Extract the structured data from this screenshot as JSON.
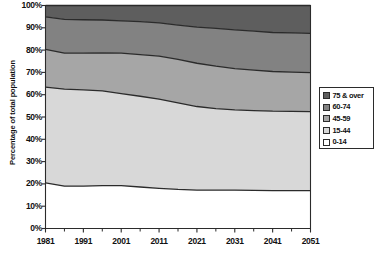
{
  "chart_data": {
    "type": "area",
    "stacked": true,
    "title": "",
    "xlabel": "",
    "ylabel": "Percentage of total population",
    "xlim": [
      1981,
      2051
    ],
    "ylim": [
      0,
      100
    ],
    "grid": false,
    "legend_position": "right",
    "x": [
      1981,
      1986,
      1991,
      1996,
      2001,
      2006,
      2011,
      2016,
      2021,
      2026,
      2031,
      2036,
      2041,
      2046,
      2051
    ],
    "x_tick_labels": [
      "1981",
      "1991",
      "2001",
      "2011",
      "2021",
      "2031",
      "2041",
      "2051"
    ],
    "x_tick_values": [
      1981,
      1991,
      2001,
      2011,
      2021,
      2031,
      2041,
      2051
    ],
    "x_minor_tick_values": [
      1986,
      1996,
      2006,
      2016,
      2026,
      2036,
      2046
    ],
    "y_tick_labels": [
      "0%",
      "10%",
      "20%",
      "30%",
      "40%",
      "50%",
      "60%",
      "70%",
      "80%",
      "90%",
      "100%"
    ],
    "y_tick_values": [
      0,
      10,
      20,
      30,
      40,
      50,
      60,
      70,
      80,
      90,
      100
    ],
    "series": [
      {
        "name": "0-14",
        "color": "#ffffff",
        "values": [
          20.5,
          19.0,
          19.0,
          19.2,
          19.2,
          18.6,
          18.0,
          17.5,
          17.2,
          17.2,
          17.2,
          17.1,
          17.0,
          17.0,
          17.0
        ]
      },
      {
        "name": "15-44",
        "color": "#d8d8d8",
        "values": [
          42.9,
          43.5,
          43.2,
          42.5,
          41.3,
          40.7,
          40.0,
          38.8,
          37.5,
          36.6,
          36.0,
          35.8,
          35.6,
          35.5,
          35.4
        ]
      },
      {
        "name": "45-59",
        "color": "#a6a6a6",
        "values": [
          16.9,
          16.1,
          16.4,
          17.1,
          18.1,
          18.7,
          19.3,
          19.5,
          19.4,
          19.0,
          18.5,
          18.1,
          17.8,
          17.6,
          17.5
        ]
      },
      {
        "name": "60-74",
        "color": "#828282",
        "values": [
          14.6,
          15.2,
          15.0,
          14.7,
          14.5,
          14.8,
          14.9,
          15.4,
          16.2,
          16.9,
          17.4,
          17.5,
          17.5,
          17.6,
          17.6
        ]
      },
      {
        "name": "75 & over",
        "color": "#5e5e5e",
        "values": [
          5.1,
          6.2,
          6.4,
          6.5,
          6.9,
          7.2,
          7.8,
          8.8,
          9.7,
          10.3,
          10.9,
          11.5,
          12.1,
          12.3,
          12.5
        ]
      }
    ],
    "cumulative_boundaries": {
      "top_of_0_14": [
        20.5,
        19.0,
        19.0,
        19.2,
        19.2,
        18.6,
        18.0,
        17.5,
        17.2,
        17.2,
        17.2,
        17.1,
        17.0,
        17.0,
        17.0
      ],
      "top_of_15_44": [
        63.4,
        62.5,
        62.2,
        61.7,
        60.5,
        59.3,
        58.0,
        56.3,
        54.7,
        53.8,
        53.2,
        52.9,
        52.6,
        52.5,
        52.4
      ],
      "top_of_45_59": [
        80.3,
        78.6,
        78.6,
        78.8,
        78.6,
        78.0,
        77.3,
        75.8,
        74.1,
        72.8,
        71.7,
        71.0,
        70.4,
        70.1,
        69.9
      ],
      "top_of_60_74": [
        94.9,
        93.8,
        93.6,
        93.5,
        93.1,
        92.8,
        92.2,
        91.2,
        90.3,
        89.7,
        89.1,
        88.5,
        87.9,
        87.7,
        87.5
      ],
      "top_of_75_over": [
        100,
        100,
        100,
        100,
        100,
        100,
        100,
        100,
        100,
        100,
        100,
        100,
        100,
        100,
        100
      ]
    }
  },
  "legend": {
    "items": [
      {
        "label": "75 & over",
        "color": "#5e5e5e"
      },
      {
        "label": "60-74",
        "color": "#828282"
      },
      {
        "label": "45-59",
        "color": "#a6a6a6"
      },
      {
        "label": "15-44",
        "color": "#d8d8d8"
      },
      {
        "label": "0-14",
        "color": "#ffffff"
      }
    ]
  },
  "axes": {
    "y_title": "Percentage of total population"
  },
  "style": {
    "line_color": "#2b2b2b",
    "axis_color": "#555555",
    "plot_background": "#ffffff"
  }
}
